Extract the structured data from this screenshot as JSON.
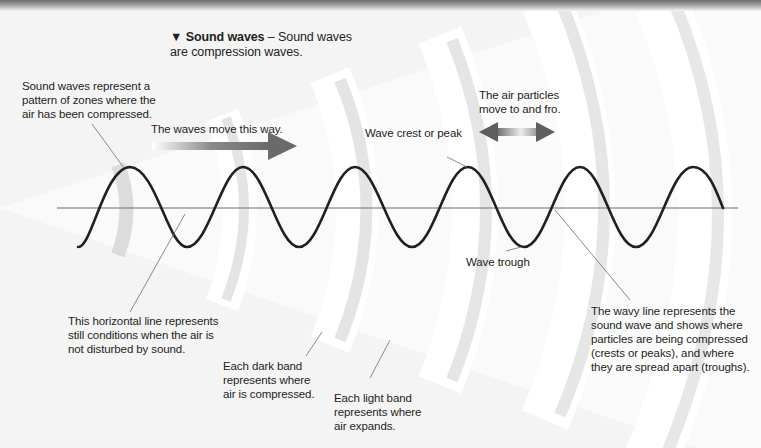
{
  "caption": {
    "marker": "▼",
    "title": "Sound waves",
    "separator": " – ",
    "text_line1": "Sound waves",
    "text_line2": "are compression waves."
  },
  "labels": {
    "zones": [
      "Sound waves represent a",
      "pattern of zones where the",
      "air has been compressed."
    ],
    "waves_move": "The waves move this way.",
    "particles": [
      "The air particles",
      "move to and fro."
    ],
    "crest": "Wave crest or peak",
    "trough": "Wave trough",
    "horizontal_line": [
      "This horizontal line represents",
      "still conditions when the air is",
      "not disturbed by sound."
    ],
    "dark_band": [
      "Each dark band",
      "represents where",
      "air is compressed."
    ],
    "light_band": [
      "Each light band",
      "represents where",
      "air expands."
    ],
    "wavy_line": [
      "The wavy line represents the",
      "sound wave and shows where",
      "particles are being compressed",
      "(crests or peaks), and where",
      "they are spread apart (troughs)."
    ]
  },
  "diagram": {
    "wave_color": "#231f20",
    "axis_color": "#6d6e71",
    "band_shadow_color": "#cfcfcf",
    "arrow_dark": "#6a6a6a",
    "arrow_light": "#e6e6e6",
    "baseline_y": 208,
    "amplitude": 40,
    "period_px": 112.5,
    "crest_x": [
      130,
      243,
      355,
      468,
      580,
      693
    ],
    "trough_x": [
      187,
      299,
      412,
      524,
      636
    ]
  }
}
